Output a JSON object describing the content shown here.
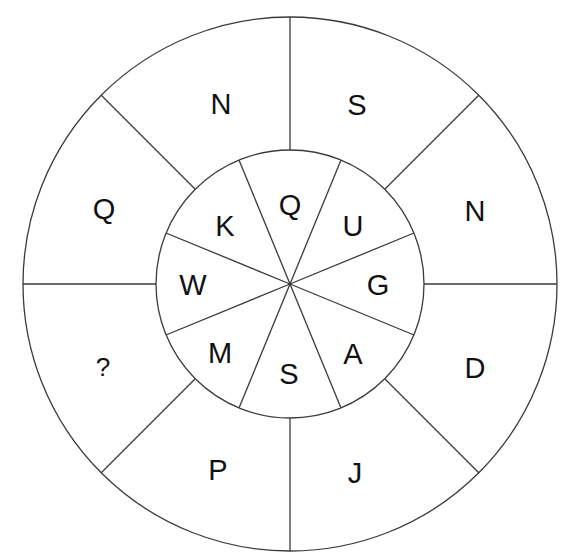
{
  "puzzle": {
    "type": "letter-wheel",
    "colors": {
      "line": "#3a3a3a",
      "text": "#111111",
      "background": "#ffffff"
    },
    "inner_ring": {
      "segments_clockwise_from_top": [
        "Q",
        "U",
        "G",
        "A",
        "S",
        "M",
        "W",
        "K"
      ]
    },
    "outer_ring": {
      "segments_clockwise_from_top_right": [
        "S",
        "N",
        "D",
        "J",
        "P",
        "?",
        "Q",
        "N"
      ]
    },
    "inner": {
      "top": "Q",
      "top_right": "U",
      "right": "G",
      "bottom_right": "A",
      "bottom": "S",
      "bottom_left": "M",
      "left": "W",
      "top_left": "K"
    },
    "outer": {
      "top_right": "S",
      "right_upper": "N",
      "right_lower": "D",
      "bottom_right": "J",
      "bottom_left": "P",
      "left_lower": "?",
      "left_upper": "Q",
      "top_left": "N"
    }
  }
}
